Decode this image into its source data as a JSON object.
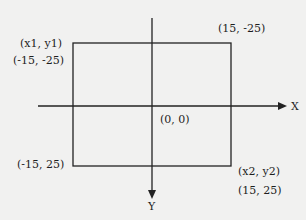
{
  "diagram": {
    "axes": {
      "x_label": "X",
      "y_label": "Y",
      "origin_label": "(0, 0)"
    },
    "rectangle": {
      "top_left_name": "(x1, y1)",
      "top_left_coords": "(-15, -25)",
      "top_right_coords": "(15, -25)",
      "bottom_left_coords": "(-15, 25)",
      "bottom_right_name": "(x2, y2)",
      "bottom_right_coords": "(15, 25)"
    },
    "colors": {
      "background": "#f1f1f0",
      "ink": "#222222"
    }
  }
}
